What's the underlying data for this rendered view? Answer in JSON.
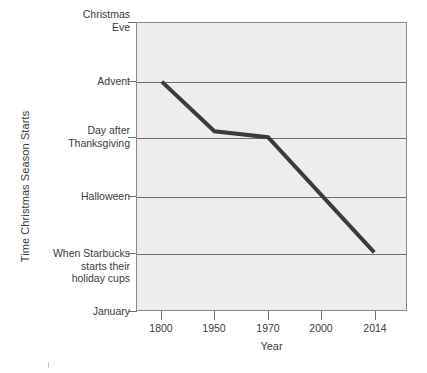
{
  "chart_data": {
    "type": "line",
    "title": "",
    "xlabel": "Year",
    "ylabel": "Time Christmas Season Starts",
    "x_tick_labels": [
      "1800",
      "1950",
      "1970",
      "2000",
      "2014"
    ],
    "y_tick_labels": [
      "Christmas\nEve",
      "Advent",
      "Day after\nThanksgiving",
      "Halloween",
      "When Starbucks\nstarts their\nholiday cups",
      "January"
    ],
    "y_categories_top_to_bottom": [
      "Christmas Eve",
      "Advent",
      "Day after Thanksgiving",
      "Halloween",
      "When Starbucks starts their holiday cups",
      "January"
    ],
    "grid": true,
    "legend": "none",
    "series": [
      {
        "name": "Time Christmas Season Starts",
        "points": [
          {
            "x": "1800",
            "y": "Advent"
          },
          {
            "x": "1950",
            "y": "slightly above Day after Thanksgiving"
          },
          {
            "x": "1970",
            "y": "Day after Thanksgiving"
          },
          {
            "x": "2014",
            "y": "When Starbucks starts their holiday cups"
          }
        ],
        "color": "#3b3b3b"
      }
    ],
    "plot_background_color": "#ededed",
    "axis_color": "#6e6e6e",
    "text_color": "#3b3b3b"
  },
  "axes": {
    "y_title": "Time Christmas Season Starts",
    "x_title": "Year",
    "y_ticks": [
      {
        "label": "Christmas\nEve",
        "top": 8
      },
      {
        "label": "Advent",
        "top": 75
      },
      {
        "label": "Day after\nThanksgiving",
        "top": 124
      },
      {
        "label": "Halloween",
        "top": 190
      },
      {
        "label": "When Starbucks\nstarts their\nholiday cups",
        "top": 247
      },
      {
        "label": "January",
        "top": 305
      }
    ],
    "y_gridlines": [
      22,
      81,
      137,
      196,
      253,
      311
    ],
    "x_ticks": [
      {
        "label": "1800",
        "left": 161
      },
      {
        "label": "1950",
        "left": 214
      },
      {
        "label": "1970",
        "left": 268
      },
      {
        "label": "2000",
        "left": 321
      },
      {
        "label": "2014",
        "left": 375
      }
    ]
  },
  "series_path": "M 25,59 L 78,109 L 132,115 L 239,231"
}
